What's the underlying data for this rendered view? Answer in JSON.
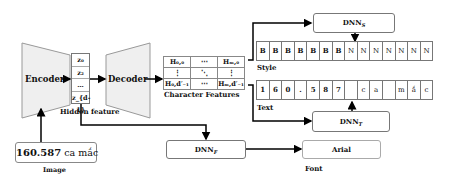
{
  "encoder": {
    "label": "Encoder"
  },
  "decoder": {
    "label": "Decoder"
  },
  "hidden_feature": {
    "caption": "Hidden feature",
    "cells": [
      "z₀",
      "z₂",
      "…",
      "z_{d-1}"
    ]
  },
  "character_features": {
    "caption": "Character Features",
    "rows": [
      [
        "H₀,₀",
        "⋯",
        "Hₘ,₀"
      ],
      [
        "⋮",
        "⋱",
        "⋮"
      ],
      [
        "H₀,d′₋₁",
        "⋯",
        "Hₘ,d′₋₁"
      ]
    ]
  },
  "dnn_s": {
    "label": "DNN",
    "subscript": "S"
  },
  "dnn_t": {
    "label": "DNN",
    "subscript": "T"
  },
  "dnn_f": {
    "label": "DNN",
    "subscript": "F"
  },
  "style": {
    "caption": "Style",
    "cells": [
      "B",
      "B",
      "B",
      "B",
      "B",
      "B",
      "B",
      "N",
      "N",
      "N",
      "N",
      "N",
      "N",
      "N"
    ]
  },
  "text": {
    "caption": "Text",
    "cells": [
      "1",
      "6",
      "0",
      ".",
      "5",
      "8",
      "7",
      "",
      "c",
      "a",
      "",
      "m",
      "ắ",
      "c"
    ]
  },
  "font": {
    "caption": "Font",
    "value": "Arial"
  },
  "image": {
    "caption": "Image",
    "number": "160.587",
    "words": "ca mắc"
  }
}
